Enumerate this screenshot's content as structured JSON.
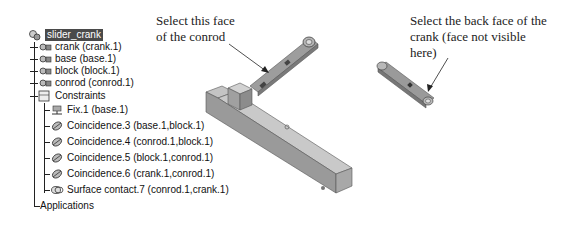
{
  "tree": {
    "root": {
      "label": "slider_crank",
      "icon": "assembly-icon",
      "selected": true
    },
    "parts": [
      {
        "label": "crank (crank.1)",
        "icon": "part-icon"
      },
      {
        "label": "base (base.1)",
        "icon": "part-icon"
      },
      {
        "label": "block (block.1)",
        "icon": "part-icon"
      },
      {
        "label": "conrod (conrod.1)",
        "icon": "part-icon"
      }
    ],
    "constraints": {
      "label": "Constraints",
      "icon": "constraints-folder-icon",
      "items": [
        {
          "label": "Fix.1 (base.1)",
          "icon": "fix-anchor-icon"
        },
        {
          "label": "Coincidence.3 (base.1,block.1)",
          "icon": "coincidence-icon"
        },
        {
          "label": "Coincidence.4 (conrod.1,block.1)",
          "icon": "coincidence-icon"
        },
        {
          "label": "Coincidence.5 (block.1,conrod.1)",
          "icon": "coincidence-icon"
        },
        {
          "label": "Coincidence.6 (crank.1,conrod.1)",
          "icon": "coincidence-icon"
        },
        {
          "label": "Surface contact.7 (conrod.1,crank.1)",
          "icon": "surface-contact-icon"
        }
      ]
    },
    "applications": {
      "label": "Applications"
    }
  },
  "callouts": {
    "conrod_face": {
      "line1": "Select this face",
      "line2": "of the conrod"
    },
    "crank_face": {
      "line1": "Select the back face of the",
      "line2": "crank (face not visible",
      "line3": "here)"
    }
  },
  "colors": {
    "selection_bg": "#4a4a4a",
    "part_top": "#bdbdbd",
    "part_side": "#8f8f8f",
    "part_dark": "#6e6e6e"
  }
}
